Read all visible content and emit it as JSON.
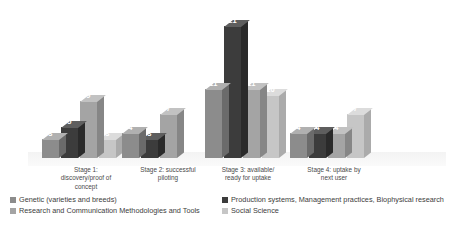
{
  "chart_data": {
    "type": "bar",
    "title": "",
    "subtitle": "",
    "xlabel": "",
    "ylabel": "",
    "grid": false,
    "legend_position": "bottom",
    "three_d": true,
    "categories": [
      "Stage 1: discovery/proof of concept",
      "Stage 2: successful piloting",
      "Stage 3: available/ ready for uptake",
      "Stage 4: uptake by next user"
    ],
    "category_lines": [
      [
        "Stage 1:",
        "discovery/proof of",
        "concept"
      ],
      [
        "Stage 2: successful",
        "piloting"
      ],
      [
        "Stage 3: available/",
        "ready for uptake"
      ],
      [
        "Stage 4: uptake by",
        "next user"
      ]
    ],
    "series": [
      {
        "name": "Genetic (varieties and breeds)",
        "color": "#8c8c8c",
        "values": [
          3,
          4,
          11,
          4
        ]
      },
      {
        "name": "Production systems, Management practices, Biophysical research",
        "color": "#3c3c3c",
        "values": [
          5,
          3,
          21,
          4
        ]
      },
      {
        "name": "Research and Communication Methodologies and Tools",
        "color": "#a4a4a4",
        "values": [
          9,
          7,
          11,
          4
        ]
      },
      {
        "name": "Social Science",
        "color": "#c6c6c6",
        "values": [
          3,
          null,
          10,
          7
        ]
      }
    ],
    "ylim": [
      0,
      21
    ],
    "value_labels_shown": true
  },
  "legend": {
    "entries": [
      {
        "label": "Genetic (varieties and breeds)",
        "color": "#8c8c8c"
      },
      {
        "label": "Production systems, Management practices, Biophysical research",
        "color": "#3c3c3c"
      },
      {
        "label": "Research and Communication Methodologies and Tools",
        "color": "#a4a4a4"
      },
      {
        "label": "Social Science",
        "color": "#c6c6c6"
      }
    ]
  },
  "caption": {
    "text": ""
  }
}
